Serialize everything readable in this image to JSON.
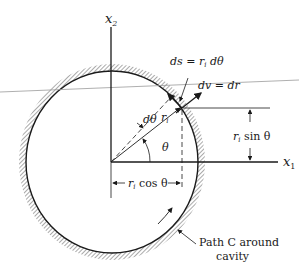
{
  "diagram": {
    "colors": {
      "ink": "#1a1a1a",
      "hatch": "#555555",
      "overlay_line": "#9a9a9a"
    },
    "axes": {
      "x1_label": "x",
      "x1_sub": "1",
      "x2_label": "x",
      "x2_sub": "2"
    },
    "labels": {
      "ds_eq": "ds = r",
      "ds_sub": "i",
      "ds_tail": " dθ",
      "dv_eq": "dv = dr",
      "ri": "r",
      "ri_sub": "i",
      "dtheta": "dθ",
      "theta": "θ",
      "risin_r": "r",
      "risin_sub": "i",
      "risin_tail": " sin θ",
      "ricos_r": "r",
      "ricos_sub": "i",
      "ricos_tail": " cos θ",
      "path_line1": "Path C around",
      "path_line2": "cavity"
    }
  }
}
